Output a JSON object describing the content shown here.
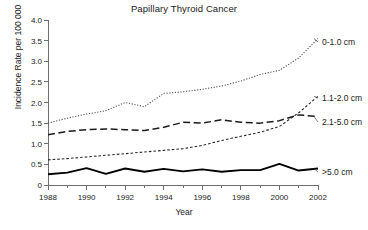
{
  "chart_data": {
    "type": "line",
    "title": "Papillary Thyroid Cancer",
    "xlabel": "Year",
    "ylabel": "Incidence Rate per 100 000",
    "x": [
      1988,
      1989,
      1990,
      1991,
      1992,
      1993,
      1994,
      1995,
      1996,
      1997,
      1998,
      1999,
      2000,
      2001,
      2002
    ],
    "xlim": [
      1988,
      2002
    ],
    "ylim": [
      0,
      4.0
    ],
    "xticks": [
      1988,
      1990,
      1992,
      1994,
      1996,
      1998,
      2000,
      2002
    ],
    "xtick_labels": [
      "1988",
      "1990",
      "1992",
      "1994",
      "1996",
      "1998",
      "2000",
      "2002"
    ],
    "xminor_ticks": [
      1989,
      1991,
      1993,
      1995,
      1997,
      1999,
      2001
    ],
    "yticks": [
      0,
      0.5,
      1.0,
      1.5,
      2.0,
      2.5,
      3.0,
      3.5,
      4.0
    ],
    "ytick_labels": [
      "0",
      "0.5",
      "1.0",
      "1.5",
      "2.0",
      "2.5",
      "3.0",
      "3.5",
      "4.0"
    ],
    "grid": false,
    "legend_position": "inline-right-labels",
    "series": [
      {
        "name": "0-1.0 cm",
        "label": "0-1.0 cm",
        "style": "dotted",
        "color": "#555555",
        "values": [
          1.5,
          1.62,
          1.72,
          1.8,
          2.0,
          1.9,
          2.22,
          2.26,
          2.32,
          2.4,
          2.52,
          2.68,
          2.78,
          3.08,
          3.55
        ]
      },
      {
        "name": "1.1-2.0 cm",
        "label": "1.1-2.0 cm",
        "style": "fine-dashed",
        "color": "#2b2b2b",
        "values": [
          0.61,
          0.64,
          0.68,
          0.72,
          0.76,
          0.8,
          0.84,
          0.88,
          0.96,
          1.08,
          1.18,
          1.28,
          1.42,
          1.75,
          2.15
        ]
      },
      {
        "name": "2.1-5.0 cm",
        "label": "2.1-5.0 cm",
        "style": "long-dashed",
        "color": "#1a1a1a",
        "values": [
          1.22,
          1.3,
          1.34,
          1.36,
          1.34,
          1.32,
          1.4,
          1.52,
          1.5,
          1.58,
          1.52,
          1.5,
          1.56,
          1.7,
          1.66
        ]
      },
      {
        "name": ">5.0 cm",
        "label": ">5.0 cm",
        "style": "solid",
        "color": "#000000",
        "values": [
          0.26,
          0.3,
          0.41,
          0.27,
          0.4,
          0.32,
          0.39,
          0.33,
          0.38,
          0.32,
          0.36,
          0.36,
          0.51,
          0.35,
          0.4
        ]
      }
    ]
  }
}
